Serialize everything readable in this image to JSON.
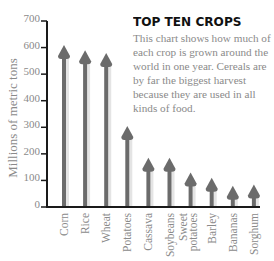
{
  "header": {
    "title": "TOP TEN CROPS",
    "description": "This chart shows how much of each crop is grown around the world in one year. Cereals are by far the biggest harvest because they are used in all kinds of food."
  },
  "colors": {
    "arrow": "#6b6b6b",
    "axis": "#1a1a1a",
    "tick_label": "#8a8a8a"
  },
  "chart_data": {
    "type": "bar",
    "title": "TOP TEN CROPS",
    "subtitle": "This chart shows how much of each crop is grown around the world in one year. Cereals are by far the biggest harvest because they are used in all kinds of food.",
    "xlabel": "",
    "ylabel": "Millions of metric tons",
    "ylim": [
      0,
      700
    ],
    "yticks": [
      0,
      100,
      200,
      300,
      400,
      500,
      600,
      700
    ],
    "grid": false,
    "legend": null,
    "categories": [
      "Corn",
      "Rice",
      "Wheat",
      "Potatoes",
      "Cassava",
      "Soybeans",
      "Sweet potatoes",
      "Barley",
      "Bananas",
      "Sorghum"
    ],
    "values": [
      610,
      590,
      580,
      305,
      185,
      185,
      130,
      110,
      80,
      85
    ],
    "style": "arrows"
  }
}
